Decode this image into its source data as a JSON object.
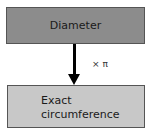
{
  "diagram": {
    "top_box": {
      "label": "Diameter",
      "color": "#8c8c8c"
    },
    "arrow": {
      "label": "× π"
    },
    "bottom_box": {
      "label": "Exact\ncircumference",
      "color": "#c8c8c8"
    }
  }
}
